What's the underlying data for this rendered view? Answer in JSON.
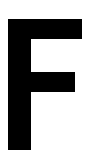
{
  "glyph": {
    "character": "F",
    "color": "#000000",
    "background": "#ffffff"
  }
}
